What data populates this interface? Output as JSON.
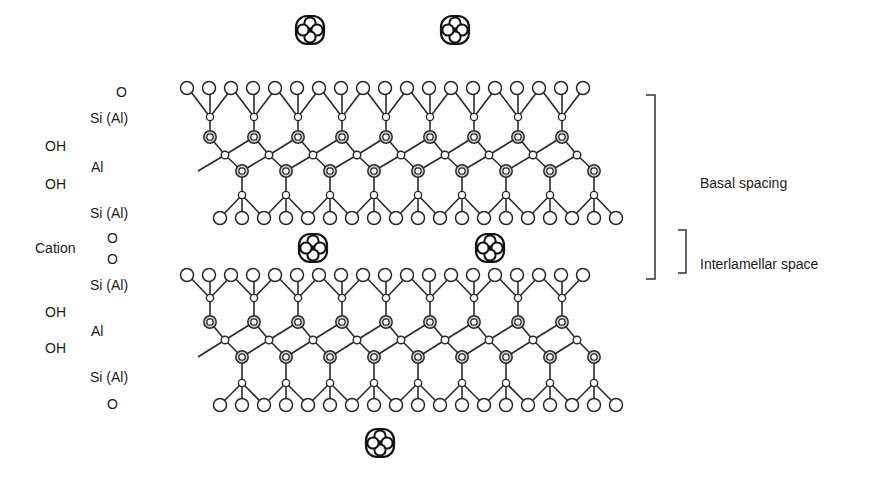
{
  "labels": {
    "layer1": {
      "o_top": "O",
      "si_top": "Si (Al)",
      "oh1": "OH",
      "al": "Al",
      "oh2": "OH",
      "si_bottom": "Si (Al)"
    },
    "interlayer": {
      "cation": "Cation",
      "o1": "O",
      "o2": "O"
    },
    "layer2": {
      "si_top": "Si (Al)",
      "oh1": "OH",
      "al": "Al",
      "oh2": "OH",
      "si_bottom": "Si (Al)",
      "o_bottom": "O"
    },
    "right": {
      "basal_spacing": "Basal spacing",
      "interlamellar_space": "Interlamellar space"
    }
  },
  "geometry": {
    "layers": [
      {
        "o_top_y": 88,
        "si_top_y": 117,
        "oct_top_y": 137,
        "oh_y": 155,
        "oct_bot_y": 171,
        "si_bot_y": 195,
        "o_bot_y": 218
      },
      {
        "o_top_y": 275,
        "si_top_y": 298,
        "oct_top_y": 322,
        "oh_y": 340,
        "oct_bot_y": 357,
        "si_bot_y": 383,
        "o_bot_y": 405
      }
    ],
    "o_top_start_x": 187,
    "o_bot_start_x": 220,
    "o_spacing": 22,
    "o_count": 19,
    "si_top_start_x": 210,
    "si_bot_start_x": 242,
    "unit_spacing": 44,
    "unit_count": 9,
    "cations": [
      {
        "x": 310,
        "y": 30
      },
      {
        "x": 455,
        "y": 30
      },
      {
        "x": 313,
        "y": 248
      },
      {
        "x": 490,
        "y": 248
      },
      {
        "x": 380,
        "y": 443
      }
    ]
  },
  "colors": {
    "stroke": "#2a2a2a",
    "background": "#ffffff"
  }
}
